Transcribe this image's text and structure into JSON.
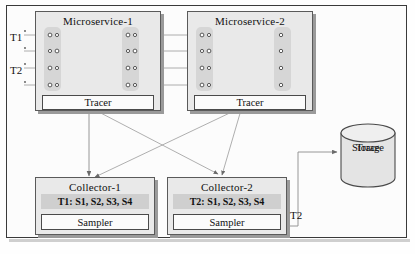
{
  "diagram": {
    "title_hidden": "",
    "microservices": [
      {
        "id": "ms1",
        "label": "Microservice-1",
        "tracer_label": "Tracer"
      },
      {
        "id": "ms2",
        "label": "Microservice-2",
        "tracer_label": "Tracer"
      }
    ],
    "trace_labels": [
      {
        "id": "t1",
        "label": "T1"
      },
      {
        "id": "t2",
        "label": "T2"
      }
    ],
    "collectors": [
      {
        "id": "collector1",
        "label": "Collector-1",
        "spans_label": "T1: S1, S2, S3, S4",
        "sampler_label": "Sampler"
      },
      {
        "id": "collector2",
        "label": "Collector-2",
        "spans_label": "T2: S1, S2, S3, S4",
        "sampler_label": "Sampler"
      }
    ],
    "storage": {
      "line1": "Trace",
      "line2": "Storage"
    },
    "edge_labels": [
      {
        "id": "t2-to-storage",
        "label": "T2"
      }
    ],
    "colors": {
      "box_fill": "#e9e9e9",
      "box_border": "#5a5a5a",
      "span_band": "#d6d6d6",
      "gray_row": "#cfcfcf",
      "line": "#8d8d8d",
      "frame_border": "#3a3a3a",
      "text": "#111111"
    }
  }
}
